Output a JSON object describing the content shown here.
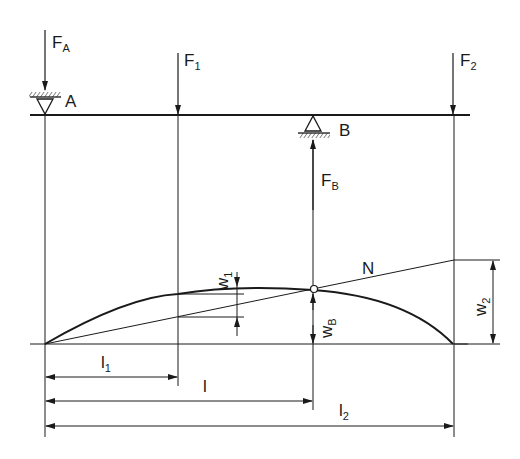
{
  "diagram": {
    "type": "beam-deflection",
    "supports": {
      "A": {
        "label": "A",
        "kind": "fixed-pin-hatched-above"
      },
      "B": {
        "label": "B",
        "kind": "pin-hatched-below"
      }
    },
    "forces": {
      "FA": {
        "main": "F",
        "sub": "A",
        "direction": "down"
      },
      "F1": {
        "main": "F",
        "sub": "1",
        "direction": "down"
      },
      "F2": {
        "main": "F",
        "sub": "2",
        "direction": "down"
      },
      "FB": {
        "main": "F",
        "sub": "B",
        "direction": "up"
      }
    },
    "deflections": {
      "w1": {
        "main": "w",
        "sub": "1"
      },
      "wB": {
        "main": "w",
        "sub": "B"
      },
      "w2": {
        "main": "w",
        "sub": "2"
      }
    },
    "line_label": "N",
    "dimensions": {
      "l1": {
        "main": "l",
        "sub": "1"
      },
      "l": {
        "main": "l",
        "sub": ""
      },
      "l2": {
        "main": "l",
        "sub": "2"
      }
    },
    "colors": {
      "ink": "#1a1a1a",
      "background": "#ffffff"
    }
  }
}
